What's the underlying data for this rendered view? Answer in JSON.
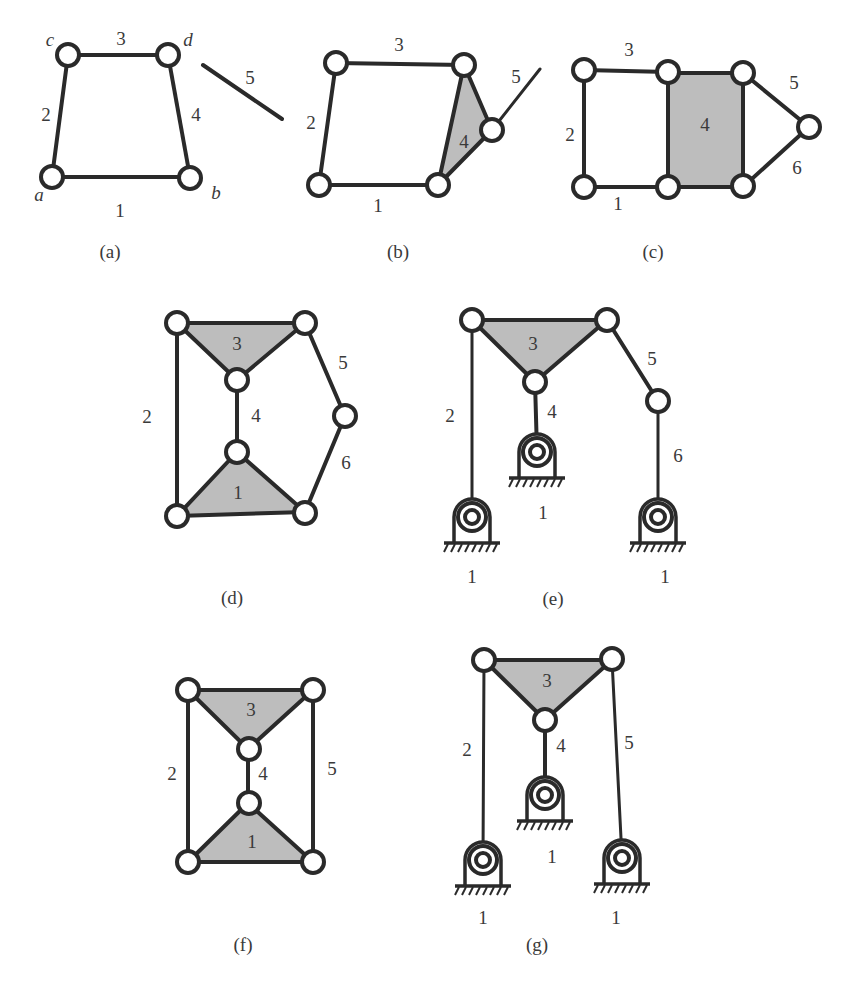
{
  "figure": {
    "panels": [
      {
        "id": "a",
        "caption": "(a)",
        "joint_labels": {
          "c": "c",
          "d": "d",
          "a": "a",
          "b": "b"
        },
        "link_labels": {
          "l1": "1",
          "l2": "2",
          "l3": "3",
          "l4": "4",
          "l5": "5"
        }
      },
      {
        "id": "b",
        "caption": "(b)",
        "link_labels": {
          "l1": "1",
          "l2": "2",
          "l3": "3",
          "l4": "4",
          "l5": "5"
        }
      },
      {
        "id": "c",
        "caption": "(c)",
        "link_labels": {
          "l1": "1",
          "l2": "2",
          "l3": "3",
          "l4": "4",
          "l5": "5",
          "l6": "6"
        }
      },
      {
        "id": "d",
        "caption": "(d)",
        "link_labels": {
          "l1": "1",
          "l2": "2",
          "l3": "3",
          "l4": "4",
          "l5": "5",
          "l6": "6"
        }
      },
      {
        "id": "e",
        "caption": "(e)",
        "link_labels": {
          "l2": "2",
          "l3": "3",
          "l4": "4",
          "l5": "5",
          "l6": "6"
        },
        "ground_labels": {
          "g1": "1",
          "g2": "1",
          "g3": "1"
        }
      },
      {
        "id": "f",
        "caption": "(f)",
        "link_labels": {
          "l1": "1",
          "l2": "2",
          "l3": "3",
          "l4": "4",
          "l5": "5"
        }
      },
      {
        "id": "g",
        "caption": "(g)",
        "link_labels": {
          "l2": "2",
          "l3": "3",
          "l4": "4",
          "l5": "5"
        },
        "ground_labels": {
          "g1": "1",
          "g2": "1",
          "g3": "1"
        }
      }
    ],
    "colors": {
      "stroke": "#2a2a2a",
      "shaded_body": "#bdbdbd",
      "joint_fill": "#ffffff",
      "text": "#3a3a3a"
    }
  }
}
